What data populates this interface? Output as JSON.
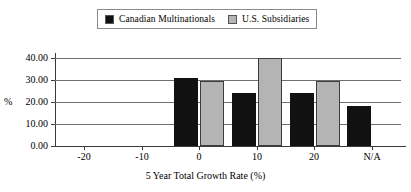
{
  "chart_data": {
    "type": "bar",
    "title": "",
    "xlabel": "5 Year Total Growth Rate (%)",
    "ylabel": "%",
    "categories": [
      "-20",
      "-10",
      "0",
      "10",
      "20",
      "N/A"
    ],
    "series": [
      {
        "name": "Canadian Multinationals",
        "color": "#111111",
        "values": [
          0,
          0,
          31,
          24,
          24,
          18
        ]
      },
      {
        "name": "U.S. Subsidiaries",
        "color": "#b4b4b4",
        "values": [
          0,
          0,
          29.5,
          40,
          29.5,
          0
        ]
      }
    ],
    "ylim": [
      0,
      40
    ],
    "yticks": [
      "0.00",
      "10.00",
      "20.00",
      "30.00",
      "40.00"
    ],
    "ytick_values": [
      0,
      10,
      20,
      30,
      40
    ],
    "grid": true,
    "legend_position": "top-center"
  },
  "legend": {
    "entries": [
      {
        "label": "Canadian Multinationals",
        "swatch": "#111111"
      },
      {
        "label": "U.S. Subsidiaries",
        "swatch": "#b4b4b4"
      }
    ]
  }
}
